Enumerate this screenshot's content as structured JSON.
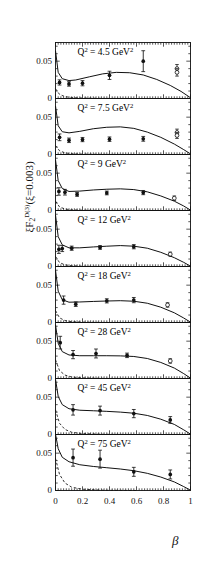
{
  "figure": {
    "ylabel_parts": {
      "xi1": "ξF",
      "sub2": "2",
      "supD3": "D(3)",
      "rest": "(ξ=0.003)"
    },
    "ylabel_plain": "ξF2D(3)(ξ=0.003)",
    "xlabel": "β"
  },
  "chart_data": {
    "type": "scatter",
    "title": "",
    "subtitle": "",
    "xlabel": "β",
    "ylabel": "ξF2D(3)(ξ=0.003)",
    "xlim": [
      0,
      1
    ],
    "ylim": [
      0,
      0.075
    ],
    "xticks": [
      0,
      0.2,
      0.4,
      0.6,
      0.8,
      1
    ],
    "xticklabels": [
      "0",
      "0.2",
      "0.4",
      "0.6",
      "0.8",
      "1"
    ],
    "yticks": [
      0,
      0.05
    ],
    "yticklabels": [
      "0",
      "0.05"
    ],
    "grid": false,
    "legend": "none",
    "panel_layout": "8 stacked panels, shared x-axis",
    "series_legend": [
      {
        "name": "filled-circle-data",
        "marker": "filled circle",
        "color": "#000000"
      },
      {
        "name": "open-circle-data",
        "marker": "open circle",
        "color": "#000000"
      },
      {
        "name": "fit-curve",
        "style": "solid line",
        "color": "#000000"
      },
      {
        "name": "secondary-curve",
        "style": "dashed line",
        "color": "#000000"
      }
    ],
    "panels": [
      {
        "label": "Q² = 4.5 GeV²",
        "q2": 4.5,
        "filled": [
          {
            "x": 0.03,
            "y": 0.0215,
            "err": 0.0035
          },
          {
            "x": 0.1,
            "y": 0.0195,
            "err": 0.003
          },
          {
            "x": 0.2,
            "y": 0.0205,
            "err": 0.0035
          },
          {
            "x": 0.4,
            "y": 0.031,
            "err": 0.0055
          },
          {
            "x": 0.65,
            "y": 0.05,
            "err": 0.014
          }
        ],
        "open": [
          {
            "x": 0.9,
            "y": 0.04,
            "err": 0.0055
          },
          {
            "x": 0.9,
            "y": 0.035,
            "err": 0.005
          }
        ],
        "solid_curve": [
          [
            0.0,
            0.064
          ],
          [
            0.02,
            0.035
          ],
          [
            0.05,
            0.0265
          ],
          [
            0.1,
            0.024
          ],
          [
            0.15,
            0.0248
          ],
          [
            0.25,
            0.029
          ],
          [
            0.35,
            0.033
          ],
          [
            0.45,
            0.035
          ],
          [
            0.55,
            0.0345
          ],
          [
            0.65,
            0.0315
          ],
          [
            0.75,
            0.0255
          ],
          [
            0.85,
            0.0175
          ],
          [
            0.93,
            0.0095
          ],
          [
            1.0,
            0.001
          ]
        ],
        "dashed_curve": [
          [
            0.0,
            0.013
          ],
          [
            0.03,
            0.0055
          ],
          [
            0.07,
            0.0025
          ],
          [
            0.12,
            0.0012
          ],
          [
            0.2,
            0.0006
          ],
          [
            0.35,
            0.0002
          ],
          [
            0.6,
            0.0
          ]
        ]
      },
      {
        "label": "Q² = 7.5 GeV²",
        "q2": 7.5,
        "filled": [
          {
            "x": 0.03,
            "y": 0.023,
            "err": 0.0045
          },
          {
            "x": 0.1,
            "y": 0.019,
            "err": 0.003
          },
          {
            "x": 0.2,
            "y": 0.02,
            "err": 0.0028
          },
          {
            "x": 0.4,
            "y": 0.0205,
            "err": 0.003
          },
          {
            "x": 0.65,
            "y": 0.021,
            "err": 0.0032
          }
        ],
        "open": [
          {
            "x": 0.9,
            "y": 0.0295,
            "err": 0.0045
          },
          {
            "x": 0.9,
            "y": 0.0255,
            "err": 0.004
          }
        ],
        "solid_curve": [
          [
            0.0,
            0.065
          ],
          [
            0.02,
            0.0385
          ],
          [
            0.05,
            0.0305
          ],
          [
            0.1,
            0.029
          ],
          [
            0.18,
            0.031
          ],
          [
            0.28,
            0.0345
          ],
          [
            0.38,
            0.0365
          ],
          [
            0.48,
            0.037
          ],
          [
            0.58,
            0.035
          ],
          [
            0.68,
            0.03
          ],
          [
            0.78,
            0.023
          ],
          [
            0.88,
            0.014
          ],
          [
            0.95,
            0.0065
          ],
          [
            1.0,
            0.0008
          ]
        ],
        "dashed_curve": [
          [
            0.0,
            0.012
          ],
          [
            0.03,
            0.005
          ],
          [
            0.07,
            0.0022
          ],
          [
            0.12,
            0.001
          ],
          [
            0.2,
            0.0005
          ],
          [
            0.35,
            0.0002
          ],
          [
            0.6,
            0.0
          ]
        ]
      },
      {
        "label": "Q² = 9 GeV²",
        "q2": 9,
        "filled": [
          {
            "x": 0.025,
            "y": 0.0255,
            "err": 0.005
          },
          {
            "x": 0.07,
            "y": 0.0245,
            "err": 0.0038
          },
          {
            "x": 0.16,
            "y": 0.0215,
            "err": 0.0025
          },
          {
            "x": 0.38,
            "y": 0.0235,
            "err": 0.0025
          },
          {
            "x": 0.65,
            "y": 0.024,
            "err": 0.0028
          }
        ],
        "open": [
          {
            "x": 0.88,
            "y": 0.0165,
            "err": 0.003
          }
        ],
        "solid_curve": [
          [
            0.0,
            0.068
          ],
          [
            0.02,
            0.04
          ],
          [
            0.05,
            0.0295
          ],
          [
            0.1,
            0.0255
          ],
          [
            0.18,
            0.026
          ],
          [
            0.28,
            0.0275
          ],
          [
            0.38,
            0.0285
          ],
          [
            0.48,
            0.029
          ],
          [
            0.58,
            0.028
          ],
          [
            0.68,
            0.025
          ],
          [
            0.78,
            0.0195
          ],
          [
            0.88,
            0.0125
          ],
          [
            0.95,
            0.006
          ],
          [
            1.0,
            0.0005
          ]
        ],
        "dashed_curve": [
          [
            0.0,
            0.0125
          ],
          [
            0.03,
            0.0048
          ],
          [
            0.07,
            0.002
          ],
          [
            0.12,
            0.0009
          ],
          [
            0.2,
            0.0004
          ],
          [
            0.35,
            0.0001
          ],
          [
            0.6,
            0.0
          ]
        ]
      },
      {
        "label": "Q² = 12 GeV²",
        "q2": 12,
        "filled": [
          {
            "x": 0.025,
            "y": 0.023,
            "err": 0.0055
          },
          {
            "x": 0.05,
            "y": 0.024,
            "err": 0.004
          },
          {
            "x": 0.12,
            "y": 0.0245,
            "err": 0.0028
          },
          {
            "x": 0.33,
            "y": 0.0255,
            "err": 0.0025
          },
          {
            "x": 0.58,
            "y": 0.0265,
            "err": 0.0028
          }
        ],
        "open": [
          {
            "x": 0.85,
            "y": 0.0165,
            "err": 0.0028
          }
        ],
        "solid_curve": [
          [
            0.0,
            0.069
          ],
          [
            0.02,
            0.04
          ],
          [
            0.05,
            0.029
          ],
          [
            0.1,
            0.025
          ],
          [
            0.18,
            0.025
          ],
          [
            0.28,
            0.0262
          ],
          [
            0.38,
            0.0272
          ],
          [
            0.48,
            0.028
          ],
          [
            0.58,
            0.0272
          ],
          [
            0.68,
            0.0245
          ],
          [
            0.78,
            0.019
          ],
          [
            0.88,
            0.0118
          ],
          [
            0.95,
            0.0055
          ],
          [
            1.0,
            0.0004
          ]
        ],
        "dashed_curve": [
          [
            0.0,
            0.0135
          ],
          [
            0.03,
            0.0052
          ],
          [
            0.07,
            0.0022
          ],
          [
            0.12,
            0.001
          ],
          [
            0.2,
            0.0004
          ],
          [
            0.35,
            0.0001
          ],
          [
            0.6,
            0.0
          ]
        ]
      },
      {
        "label": "Q² = 18 GeV²",
        "q2": 18,
        "filled": [
          {
            "x": 0.06,
            "y": 0.03,
            "err": 0.0055
          },
          {
            "x": 0.15,
            "y": 0.0245,
            "err": 0.003
          },
          {
            "x": 0.38,
            "y": 0.029,
            "err": 0.0028
          },
          {
            "x": 0.58,
            "y": 0.03,
            "err": 0.0035
          }
        ],
        "open": [
          {
            "x": 0.83,
            "y": 0.0235,
            "err": 0.003
          }
        ],
        "solid_curve": [
          [
            0.0,
            0.07
          ],
          [
            0.02,
            0.042
          ],
          [
            0.05,
            0.0305
          ],
          [
            0.1,
            0.0272
          ],
          [
            0.18,
            0.0275
          ],
          [
            0.28,
            0.0282
          ],
          [
            0.38,
            0.0288
          ],
          [
            0.48,
            0.0292
          ],
          [
            0.58,
            0.0285
          ],
          [
            0.68,
            0.0258
          ],
          [
            0.78,
            0.0205
          ],
          [
            0.88,
            0.013
          ],
          [
            0.95,
            0.006
          ],
          [
            1.0,
            0.0004
          ]
        ],
        "dashed_curve": [
          [
            0.0,
            0.016
          ],
          [
            0.03,
            0.0062
          ],
          [
            0.07,
            0.0026
          ],
          [
            0.12,
            0.0011
          ],
          [
            0.2,
            0.0005
          ],
          [
            0.35,
            0.0001
          ],
          [
            0.6,
            0.0
          ]
        ]
      },
      {
        "label": "Q² = 28 GeV²",
        "q2": 28,
        "filled": [
          {
            "x": 0.035,
            "y": 0.048,
            "err": 0.0085
          },
          {
            "x": 0.13,
            "y": 0.032,
            "err": 0.0055
          },
          {
            "x": 0.3,
            "y": 0.0335,
            "err": 0.006
          },
          {
            "x": 0.53,
            "y": 0.031,
            "err": 0.003
          }
        ],
        "open": [
          {
            "x": 0.85,
            "y": 0.0235,
            "err": 0.003
          }
        ],
        "solid_curve": [
          [
            0.0,
            0.072
          ],
          [
            0.02,
            0.047
          ],
          [
            0.05,
            0.036
          ],
          [
            0.1,
            0.0315
          ],
          [
            0.18,
            0.0305
          ],
          [
            0.28,
            0.0305
          ],
          [
            0.38,
            0.0305
          ],
          [
            0.48,
            0.0303
          ],
          [
            0.58,
            0.0295
          ],
          [
            0.68,
            0.0268
          ],
          [
            0.78,
            0.0215
          ],
          [
            0.88,
            0.014
          ],
          [
            0.95,
            0.0065
          ],
          [
            1.0,
            0.0005
          ]
        ],
        "dashed_curve": [
          [
            0.0,
            0.025
          ],
          [
            0.03,
            0.0105
          ],
          [
            0.07,
            0.0046
          ],
          [
            0.12,
            0.002
          ],
          [
            0.2,
            0.0008
          ],
          [
            0.35,
            0.0002
          ],
          [
            0.6,
            0.0
          ]
        ]
      },
      {
        "label": "Q² = 45 GeV²",
        "q2": 45,
        "filled": [
          {
            "x": 0.13,
            "y": 0.033,
            "err": 0.007
          },
          {
            "x": 0.33,
            "y": 0.032,
            "err": 0.006
          },
          {
            "x": 0.58,
            "y": 0.028,
            "err": 0.0055
          },
          {
            "x": 0.85,
            "y": 0.0195,
            "err": 0.0045
          }
        ],
        "open": [],
        "solid_curve": [
          [
            0.0,
            0.074
          ],
          [
            0.02,
            0.051
          ],
          [
            0.05,
            0.04
          ],
          [
            0.1,
            0.0345
          ],
          [
            0.18,
            0.0325
          ],
          [
            0.28,
            0.0318
          ],
          [
            0.38,
            0.031
          ],
          [
            0.48,
            0.03
          ],
          [
            0.58,
            0.0285
          ],
          [
            0.68,
            0.0255
          ],
          [
            0.78,
            0.0205
          ],
          [
            0.88,
            0.0135
          ],
          [
            0.95,
            0.0062
          ],
          [
            1.0,
            0.0005
          ]
        ],
        "dashed_curve": [
          [
            0.0,
            0.033
          ],
          [
            0.03,
            0.015
          ],
          [
            0.07,
            0.0068
          ],
          [
            0.12,
            0.003
          ],
          [
            0.2,
            0.0012
          ],
          [
            0.35,
            0.0003
          ],
          [
            0.6,
            0.0
          ]
        ]
      },
      {
        "label": "Q² = 75 GeV²",
        "q2": 75,
        "filled": [
          {
            "x": 0.13,
            "y": 0.044,
            "err": 0.0115
          },
          {
            "x": 0.33,
            "y": 0.042,
            "err": 0.012
          },
          {
            "x": 0.58,
            "y": 0.025,
            "err": 0.006
          },
          {
            "x": 0.85,
            "y": 0.0215,
            "err": 0.006
          }
        ],
        "open": [],
        "solid_curve": [
          [
            0.0,
            0.0755
          ],
          [
            0.02,
            0.056
          ],
          [
            0.05,
            0.0445
          ],
          [
            0.1,
            0.0385
          ],
          [
            0.18,
            0.0345
          ],
          [
            0.28,
            0.0322
          ],
          [
            0.38,
            0.0305
          ],
          [
            0.48,
            0.0288
          ],
          [
            0.58,
            0.0265
          ],
          [
            0.68,
            0.023
          ],
          [
            0.78,
            0.018
          ],
          [
            0.88,
            0.0115
          ],
          [
            0.95,
            0.0052
          ],
          [
            1.0,
            0.0004
          ]
        ],
        "dashed_curve": [
          [
            0.0,
            0.043
          ],
          [
            0.03,
            0.0215
          ],
          [
            0.07,
            0.01
          ],
          [
            0.12,
            0.0044
          ],
          [
            0.2,
            0.0017
          ],
          [
            0.35,
            0.0004
          ],
          [
            0.6,
            0.0
          ]
        ]
      }
    ]
  }
}
